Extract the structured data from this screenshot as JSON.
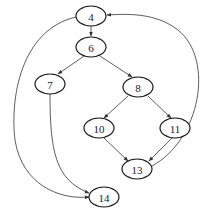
{
  "diagram": {
    "type": "control-flow-graph",
    "nodes": [
      {
        "id": "n4",
        "label": "4",
        "cx": 91,
        "cy": 16,
        "rx": 15,
        "ry": 10
      },
      {
        "id": "n6",
        "label": "6",
        "cx": 91,
        "cy": 47,
        "rx": 15,
        "ry": 10
      },
      {
        "id": "n7",
        "label": "7",
        "cx": 50,
        "cy": 84,
        "rx": 15,
        "ry": 10
      },
      {
        "id": "n8",
        "label": "8",
        "cx": 138,
        "cy": 87,
        "rx": 15,
        "ry": 10
      },
      {
        "id": "n10",
        "label": "10",
        "cx": 99,
        "cy": 128,
        "rx": 15,
        "ry": 10
      },
      {
        "id": "n11",
        "label": "11",
        "cx": 175,
        "cy": 128,
        "rx": 15,
        "ry": 10
      },
      {
        "id": "n13",
        "label": "13",
        "cx": 137,
        "cy": 169,
        "rx": 15,
        "ry": 10
      },
      {
        "id": "n14",
        "label": "14",
        "cx": 104,
        "cy": 197,
        "rx": 15,
        "ry": 10
      }
    ],
    "edges": [
      {
        "from": "4",
        "to": "6",
        "path": "M91 26 L91 36"
      },
      {
        "from": "6",
        "to": "7",
        "path": "M84 56 L58 74"
      },
      {
        "from": "6",
        "to": "8",
        "path": "M100 56 L132 77"
      },
      {
        "from": "8",
        "to": "10",
        "path": "M128 96 L104 118"
      },
      {
        "from": "8",
        "to": "11",
        "path": "M148 96 L171 118"
      },
      {
        "from": "10",
        "to": "13",
        "path": "M104 138 L128 161"
      },
      {
        "from": "11",
        "to": "13",
        "path": "M172 138 L149 161"
      },
      {
        "from": "13",
        "to": "4",
        "path": "M152 166 C 200 140, 215 60, 178 30 C 155 12, 125 14, 107 15"
      },
      {
        "from": "7",
        "to": "14",
        "path": "M50 94 C 50 150, 55 180, 89 193"
      },
      {
        "from": "4",
        "to": "14",
        "path": "M76 17 C 20 30, 10 100, 15 140 C 22 185, 60 200, 89 197"
      }
    ],
    "caption": ""
  }
}
